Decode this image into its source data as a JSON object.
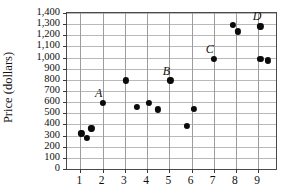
{
  "chart_data": {
    "type": "scatter",
    "title": "",
    "xlabel": "",
    "ylabel": "Price (dollars)",
    "xlim": [
      0.4,
      9.8
    ],
    "ylim": [
      0,
      1400
    ],
    "grid": true,
    "legend": "none",
    "x_ticks": [
      1,
      2,
      3,
      4,
      5,
      6,
      7,
      8,
      9
    ],
    "x_tick_labels": [
      "1",
      "2",
      "3",
      "4",
      "5",
      "6",
      "7",
      "8",
      "9"
    ],
    "y_ticks": [
      0,
      100,
      200,
      300,
      400,
      500,
      600,
      700,
      800,
      900,
      1000,
      1100,
      1200,
      1300,
      1400
    ],
    "y_tick_labels": [
      "0",
      "100",
      "200",
      "300",
      "400",
      "500",
      "600",
      "700",
      "800",
      "900",
      "1,000",
      "1,100",
      "1,200",
      "1,300",
      "1,400"
    ],
    "points": [
      {
        "x": 1.05,
        "y": 320
      },
      {
        "x": 1.28,
        "y": 280
      },
      {
        "x": 1.5,
        "y": 365
      },
      {
        "x": 2.0,
        "y": 595
      },
      {
        "x": 3.05,
        "y": 795
      },
      {
        "x": 3.55,
        "y": 555
      },
      {
        "x": 4.1,
        "y": 590
      },
      {
        "x": 4.5,
        "y": 535
      },
      {
        "x": 5.05,
        "y": 795
      },
      {
        "x": 5.8,
        "y": 390
      },
      {
        "x": 6.1,
        "y": 540
      },
      {
        "x": 7.0,
        "y": 990
      },
      {
        "x": 7.85,
        "y": 1290
      },
      {
        "x": 8.1,
        "y": 1235
      },
      {
        "x": 9.1,
        "y": 1280
      },
      {
        "x": 9.1,
        "y": 985
      },
      {
        "x": 9.45,
        "y": 975
      }
    ],
    "annotations": [
      {
        "label": "A",
        "x": 1.82,
        "y": 680
      },
      {
        "label": "B",
        "x": 4.87,
        "y": 880
      },
      {
        "label": "C",
        "x": 6.82,
        "y": 1075
      },
      {
        "label": "D",
        "x": 8.95,
        "y": 1370
      }
    ]
  }
}
